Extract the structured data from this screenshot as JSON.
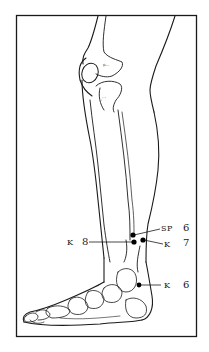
{
  "figure": {
    "frame_color": "#1a1a1a",
    "line_color": "#1a1a1a",
    "point_color": "#000000"
  },
  "points": [
    {
      "id": "sp6",
      "meridian": "SP",
      "number": "6",
      "x": 133,
      "y": 235
    },
    {
      "id": "k8",
      "meridian": "K",
      "number": "8",
      "x": 134,
      "y": 242
    },
    {
      "id": "k7",
      "meridian": "K",
      "number": "7",
      "x": 143,
      "y": 240
    },
    {
      "id": "k6",
      "meridian": "K",
      "number": "6",
      "x": 139,
      "y": 285
    }
  ],
  "labels": {
    "sp6": {
      "meridian": "SP",
      "number": "6"
    },
    "k7": {
      "meridian": "K",
      "number": "7"
    },
    "k8": {
      "meridian": "K",
      "number": "8"
    },
    "k6": {
      "meridian": "K",
      "number": "6"
    }
  }
}
